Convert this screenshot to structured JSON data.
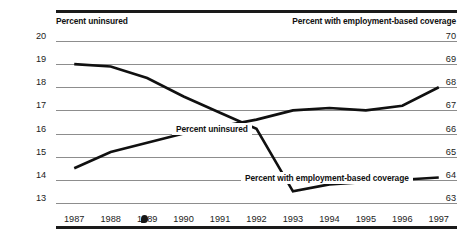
{
  "figure": {
    "left_axis_caption": "Percent uninsured",
    "right_axis_caption": "Percent with employment-based coverage"
  },
  "chart_data": {
    "type": "line",
    "title": "",
    "xlabel": "",
    "ylabel": "Percent uninsured",
    "y2label": "Percent with employment-based coverage",
    "grid": true,
    "legend_position": "inline-labels",
    "categories": [
      "1987",
      "1988",
      "1989",
      "1990",
      "1991",
      "1992",
      "1993",
      "1994",
      "1995",
      "1996",
      "1997"
    ],
    "ylim": [
      13,
      20
    ],
    "y2lim": [
      63,
      70
    ],
    "yticks": [
      "13",
      "14",
      "15",
      "16",
      "17",
      "18",
      "19",
      "20"
    ],
    "y2ticks": [
      "63",
      "64",
      "65",
      "66",
      "67",
      "68",
      "69",
      "70"
    ],
    "series": [
      {
        "name": "Percent uninsured",
        "axis": "left",
        "inline_label": "Percent uninsured",
        "values": [
          14.5,
          15.2,
          15.6,
          16.0,
          16.3,
          16.6,
          17.0,
          17.1,
          17.0,
          17.2,
          18.0
        ]
      },
      {
        "name": "Percent with employment-based coverage",
        "axis": "right",
        "inline_label": "Percent with employment-based coverage",
        "values": [
          69.0,
          68.9,
          68.4,
          67.6,
          66.9,
          66.2,
          63.5,
          63.8,
          63.9,
          64.0,
          64.1
        ]
      }
    ],
    "colors": {
      "line": "#101010",
      "gridline": "#8d8d8d",
      "rule": "#1a1a1a",
      "text": "#1b1b1b"
    }
  }
}
